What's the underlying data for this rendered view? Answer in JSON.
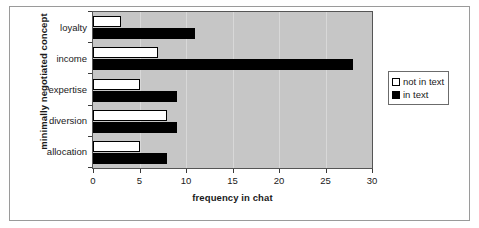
{
  "chart_data": {
    "type": "bar",
    "orientation": "horizontal",
    "title": "",
    "xlabel": "frequency in chat",
    "ylabel": "minimally negotiated concept",
    "categories": [
      "loyalty",
      "income",
      "expertise",
      "diversion",
      "allocation"
    ],
    "series": [
      {
        "name": "not in text",
        "color": "#ffffff",
        "values": [
          3,
          7,
          5,
          8,
          5
        ]
      },
      {
        "name": "in text",
        "color": "#000000",
        "values": [
          11,
          28,
          9,
          9,
          8
        ]
      }
    ],
    "xlim": [
      0,
      30
    ],
    "xticks": [
      0,
      5,
      10,
      15,
      20,
      25,
      30
    ],
    "xtick_labels": [
      "0",
      "5",
      "10",
      "15",
      "20",
      "25",
      "30"
    ],
    "grid": "vertical",
    "legend_position": "right",
    "plot_background": "#c6c6c6",
    "gridline_color": "#d8d8d8"
  },
  "legend": {
    "entries": [
      {
        "label": "not in text",
        "swatch": "hollow"
      },
      {
        "label": "in text",
        "swatch": "filled"
      }
    ]
  }
}
